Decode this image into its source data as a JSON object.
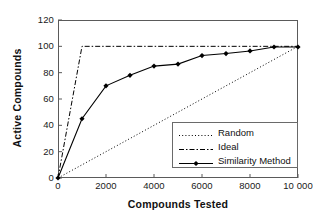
{
  "chart_data": {
    "type": "line",
    "title": "",
    "xlabel": "Compounds Tested",
    "ylabel": "Active Compounds",
    "xlim": [
      0,
      10000
    ],
    "ylim": [
      0,
      120
    ],
    "grid": false,
    "legend_position": "lower right",
    "xticks": [
      0,
      2000,
      4000,
      6000,
      8000,
      10000
    ],
    "xtick_labels": [
      "0",
      "2000",
      "4000",
      "6000",
      "8000",
      "10 000"
    ],
    "yticks": [
      0,
      20,
      40,
      60,
      80,
      100,
      120
    ],
    "ytick_labels": [
      "0",
      "20",
      "40",
      "60",
      "80",
      "100",
      "120"
    ],
    "series": [
      {
        "name": "Random",
        "style": "dotted",
        "marker": "none",
        "color": "#000000",
        "x": [
          0,
          10000
        ],
        "values": [
          0,
          100
        ]
      },
      {
        "name": "Ideal",
        "style": "dash-dot",
        "marker": "none",
        "color": "#000000",
        "x": [
          0,
          1000,
          10000
        ],
        "values": [
          0,
          100,
          100
        ]
      },
      {
        "name": "Similarity Method",
        "style": "solid",
        "marker": "diamond",
        "color": "#000000",
        "x": [
          0,
          1000,
          2000,
          3000,
          4000,
          5000,
          6000,
          7000,
          8000,
          9000,
          10000
        ],
        "values": [
          0,
          45,
          70,
          78,
          85,
          86.5,
          93,
          94.5,
          96.5,
          99.5,
          99.5
        ]
      }
    ]
  },
  "axes": {
    "x_title": "Compounds Tested",
    "y_title": "Active Compounds"
  },
  "legend": {
    "items": [
      {
        "label": "Random"
      },
      {
        "label": "Ideal"
      },
      {
        "label": "Similarity Method"
      }
    ]
  },
  "colors": {
    "line": "#000000",
    "frame": "#5a5a5a",
    "text": "#111111"
  }
}
